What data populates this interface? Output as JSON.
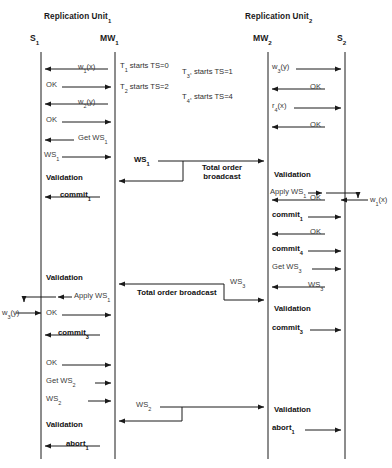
{
  "diagram": {
    "type": "sequence-diagram",
    "units": [
      {
        "id": "unit1",
        "label": "Replication Unit",
        "sub": "1"
      },
      {
        "id": "unit2",
        "label": "Replication Unit",
        "sub": "2"
      }
    ],
    "lifelines": [
      {
        "id": "s1",
        "label": "S",
        "sub": "1",
        "x": 41
      },
      {
        "id": "mw1",
        "label": "MW",
        "sub": "1",
        "x": 115
      },
      {
        "id": "mw2",
        "label": "MW",
        "sub": "2",
        "x": 268
      },
      {
        "id": "s2",
        "label": "S",
        "sub": "2",
        "x": 345
      }
    ],
    "timestamps": [
      {
        "text": "T",
        "sub": "1",
        "rest": " starts TS=0",
        "x": 120,
        "y": 62
      },
      {
        "text": "T",
        "sub": "2",
        "rest": " starts TS=2",
        "x": 120,
        "y": 83
      },
      {
        "text": "T",
        "sub": "3",
        "rest": ", starts TS=1",
        "x": 182,
        "y": 68
      },
      {
        "text": "T",
        "sub": "4",
        "rest": ", starts TS=4",
        "x": 182,
        "y": 93
      }
    ],
    "messages_left": [
      {
        "label": "w",
        "sub": "1",
        "rest": "(x)",
        "dir": "left",
        "bold": false,
        "y": 66
      },
      {
        "label": "OK",
        "sub": "",
        "rest": "",
        "dir": "right",
        "bold": false,
        "y": 84
      },
      {
        "label": "w",
        "sub": "2",
        "rest": "(y)",
        "dir": "left",
        "bold": false,
        "y": 101
      },
      {
        "label": "OK",
        "sub": "",
        "rest": "",
        "dir": "right",
        "bold": false,
        "y": 119
      },
      {
        "label": "Get WS",
        "sub": "1",
        "rest": "",
        "dir": "left",
        "bold": false,
        "y": 137
      },
      {
        "label": "WS",
        "sub": "1",
        "rest": "",
        "dir": "right",
        "bold": false,
        "y": 154
      },
      {
        "label": "commit",
        "sub": "1",
        "rest": "",
        "dir": "left",
        "bold": true,
        "y": 194
      },
      {
        "label": "OK",
        "sub": "",
        "rest": "",
        "dir": "right",
        "bold": false,
        "y": 312
      },
      {
        "label": "commit",
        "sub": "3",
        "rest": "",
        "dir": "left",
        "bold": true,
        "y": 332
      },
      {
        "label": "OK",
        "sub": "",
        "rest": "",
        "dir": "right",
        "bold": false,
        "y": 362
      },
      {
        "label": "Get WS",
        "sub": "2",
        "rest": "",
        "dir": "right",
        "bold": false,
        "y": 380
      },
      {
        "label": "WS",
        "sub": "2",
        "rest": "",
        "dir": "right",
        "bold": false,
        "y": 398
      },
      {
        "label": "abort",
        "sub": "1",
        "rest": "",
        "dir": "left",
        "bold": true,
        "y": 443
      }
    ],
    "messages_right": [
      {
        "label": "w",
        "sub": "3",
        "rest": "(y)",
        "dir": "right",
        "bold": false,
        "y": 66
      },
      {
        "label": "OK",
        "sub": "",
        "rest": "",
        "dir": "left",
        "bold": false,
        "y": 86
      },
      {
        "label": "r",
        "sub": "4",
        "rest": "(x)",
        "dir": "right",
        "bold": false,
        "y": 105
      },
      {
        "label": "OK",
        "sub": "",
        "rest": "",
        "dir": "left",
        "bold": false,
        "y": 124
      },
      {
        "label": "OK",
        "sub": "",
        "rest": "",
        "dir": "left",
        "bold": false,
        "y": 197
      },
      {
        "label": "commit",
        "sub": "1",
        "rest": "",
        "dir": "right",
        "bold": true,
        "y": 214
      },
      {
        "label": "OK",
        "sub": "",
        "rest": "",
        "dir": "left",
        "bold": false,
        "y": 231
      },
      {
        "label": "commit",
        "sub": "4",
        "rest": "",
        "dir": "right",
        "bold": true,
        "y": 248
      },
      {
        "label": "Get WS",
        "sub": "3",
        "rest": "",
        "dir": "right",
        "bold": false,
        "y": 266
      },
      {
        "label": "WS",
        "sub": "3",
        "rest": "",
        "dir": "left",
        "bold": false,
        "y": 284
      },
      {
        "label": "commit",
        "sub": "3",
        "rest": "",
        "dir": "right",
        "bold": true,
        "y": 327
      },
      {
        "label": "abort",
        "sub": "1",
        "rest": "",
        "dir": "right",
        "bold": true,
        "y": 427
      }
    ],
    "validations": [
      {
        "text": "Validation",
        "side": "left",
        "x": 46,
        "y": 177
      },
      {
        "text": "Validation",
        "side": "right",
        "x": 274,
        "y": 174
      },
      {
        "text": "Validation",
        "side": "left",
        "x": 46,
        "y": 277
      },
      {
        "text": "Validation",
        "side": "right",
        "x": 274,
        "y": 308
      },
      {
        "text": "Validation",
        "side": "right",
        "x": 274,
        "y": 409
      },
      {
        "text": "Validation",
        "side": "left",
        "x": 46,
        "y": 424
      }
    ],
    "apply_ops": [
      {
        "label": "Apply WS",
        "sub": "1",
        "dir": "right",
        "x": 272,
        "y": 190
      },
      {
        "label": "Apply WS",
        "sub": "1",
        "dir": "left",
        "x": 62,
        "y": 294
      }
    ],
    "external_ops": [
      {
        "label": "w",
        "sub": "1",
        "rest": "(x)",
        "x": 358,
        "y": 205
      },
      {
        "label": "w",
        "sub": "3",
        "rest": "(y)",
        "x": 5,
        "y": 310
      }
    ],
    "broadcasts": [
      {
        "id": "bc1",
        "ws_label": "WS",
        "ws_sub": "1",
        "text_line1": "Total order",
        "text_line2": "broadcast",
        "ws_x": 134,
        "ws_y": 158,
        "text_x": 175,
        "text_y": 167,
        "direction": "right-then-back-left"
      },
      {
        "id": "bc2",
        "ws_label": "WS",
        "ws_sub": "3",
        "text_line1": "Total order broadcast",
        "text_line2": "",
        "ws_x": 228,
        "ws_y": 280,
        "text_x": 137,
        "text_y": 293,
        "direction": "left-then-down-right"
      },
      {
        "id": "bc3",
        "ws_label": "WS",
        "ws_sub": "2",
        "text_line1": "",
        "text_line2": "",
        "ws_x": 136,
        "ws_y": 404,
        "text_x": 0,
        "text_y": 0,
        "direction": "right-then-back-left"
      }
    ],
    "colors": {
      "line": "#1a1a1a",
      "text": "#1a1a1a",
      "muted": "#3a3a3a",
      "background": "#ffffff"
    }
  }
}
